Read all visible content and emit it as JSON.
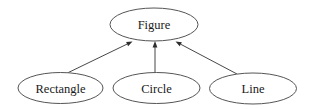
{
  "diagram": {
    "kind": "class-inheritance-hierarchy",
    "background_color": "#ffffff",
    "node_stroke_color": "#555555",
    "edge_color": "#474747",
    "arrowhead_color": "#2e2e2e",
    "text_color": "#1a1a1a",
    "root": {
      "label": "Figure"
    },
    "children": [
      {
        "label": "Rectangle"
      },
      {
        "label": "Circle"
      },
      {
        "label": "Line"
      }
    ],
    "edges": [
      {
        "from": "Rectangle",
        "to": "Figure"
      },
      {
        "from": "Circle",
        "to": "Figure"
      },
      {
        "from": "Line",
        "to": "Figure"
      }
    ]
  }
}
